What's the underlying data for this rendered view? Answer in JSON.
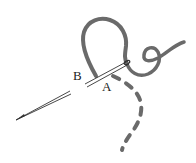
{
  "diagram": {
    "labels": {
      "a": "A",
      "b": "B"
    },
    "colors": {
      "thread": "#666666",
      "needle": "#333333",
      "background": "#ffffff",
      "label": "#222222"
    },
    "elements": [
      {
        "name": "needle",
        "description": "sewing needle passing through fabric from left to right"
      },
      {
        "name": "thread-loop",
        "description": "solid thread loop above needle"
      },
      {
        "name": "thread-curl",
        "description": "curled thread tail to the right"
      },
      {
        "name": "dashed-thread",
        "description": "dashed thread path curving downward (hidden under fabric)"
      }
    ]
  }
}
